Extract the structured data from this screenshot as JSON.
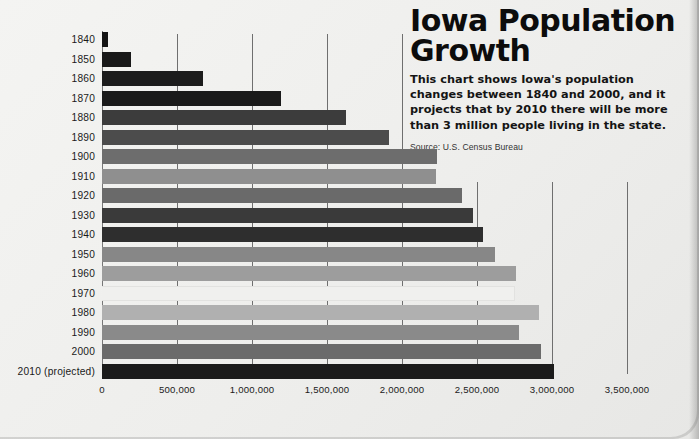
{
  "title": "Iowa Population\nGrowth",
  "description": "This chart shows Iowa's population changes between 1840 and 2000, and it projects that by 2010 there will be more than 3 million people living in the state.",
  "source": "Source: U.S. Census Bureau",
  "chart_data": {
    "type": "bar",
    "orientation": "horizontal",
    "title": "Iowa Population Growth",
    "subtitle": "This chart shows Iowa's population changes between 1840 and 2000, and it projects that by 2010 there will be more than 3 million people living in the state.",
    "source": "Source: U.S. Census Bureau",
    "xlabel": "",
    "ylabel": "",
    "xlim": [
      0,
      3500000
    ],
    "grid": true,
    "legend": "none",
    "xticks": [
      0,
      500000,
      1000000,
      1500000,
      2000000,
      2500000,
      3000000,
      3500000
    ],
    "xticklabels": [
      "0",
      "500,000",
      "1,000,000",
      "1,500,000",
      "2,000,000",
      "2,500,000",
      "3,000,000",
      "3,500,000"
    ],
    "categories": [
      "1840",
      "1850",
      "1860",
      "1870",
      "1880",
      "1890",
      "1900",
      "1910",
      "1920",
      "1930",
      "1940",
      "1950",
      "1960",
      "1970",
      "1980",
      "1990",
      "2000",
      "2010 (projected)"
    ],
    "values": [
      43000,
      192000,
      675000,
      1195000,
      1625000,
      1910000,
      2230000,
      2225000,
      2400000,
      2470000,
      2540000,
      2620000,
      2760000,
      2755000,
      2915000,
      2780000,
      2925000,
      3010000
    ],
    "colors": [
      "#141414",
      "#191919",
      "#1c1c1c",
      "#1a1a1a",
      "#3c3c3c",
      "#4c4c4c",
      "#6d6d6d",
      "#8f8f8f",
      "#6a6a6a",
      "#3a3a3a",
      "#2e2e2e",
      "#878787",
      "#9d9d9d",
      "#f0f0ee",
      "#b0b0b0",
      "#8a8a8a",
      "#6b6b6b",
      "#1b1b1b"
    ]
  }
}
